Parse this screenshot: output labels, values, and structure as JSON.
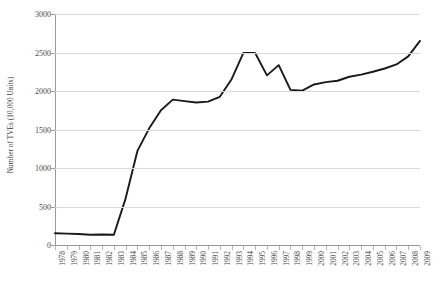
{
  "chart_data": {
    "type": "line",
    "title": "",
    "xlabel": "",
    "ylabel": "Number of TVEs (10,000 Units)",
    "ylim": [
      0,
      3000
    ],
    "ytick_values": [
      0,
      500,
      1000,
      1500,
      2000,
      2500,
      3000
    ],
    "ytick_labels": [
      "0",
      "500",
      "1000",
      "1500",
      "2000",
      "2500",
      "3000"
    ],
    "grid": true,
    "legend": "none",
    "line_color": "#1a1a1a",
    "grid_color": "#d9d9d9",
    "axis_color": "#9a9a9a",
    "categories": [
      "1978",
      "1979",
      "1980",
      "1981",
      "1982",
      "1983",
      "1984",
      "1985",
      "1986",
      "1987",
      "1988",
      "1989",
      "1990",
      "1991",
      "1992",
      "1993",
      "1994",
      "1995",
      "1996",
      "1997",
      "1998",
      "1999",
      "2000",
      "2001",
      "2002",
      "2003",
      "2004",
      "2005",
      "2006",
      "2007",
      "2008",
      "2009"
    ],
    "values": [
      152,
      148,
      142,
      134,
      136,
      134,
      606,
      1222,
      1515,
      1750,
      1888,
      1869,
      1850,
      1862,
      1925,
      2153,
      2495,
      2494,
      2203,
      2336,
      2015,
      2004,
      2085,
      2116,
      2133,
      2185,
      2213,
      2250,
      2292,
      2345,
      2450,
      2650
    ],
    "series_name": "Number of TVEs"
  }
}
